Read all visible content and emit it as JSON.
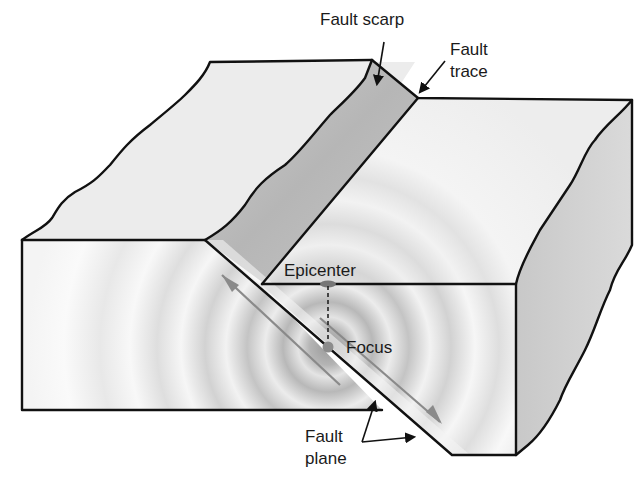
{
  "figure": {
    "labels": {
      "fault_scarp": "Fault scarp",
      "fault_trace_line1": "Fault",
      "fault_trace_line2": "trace",
      "epicenter": "Epicenter",
      "focus": "Focus",
      "fault_plane_line1": "Fault",
      "fault_plane_line2": "plane"
    },
    "colors": {
      "background": "#ffffff",
      "top_surface": "#ececec",
      "front_face": "#f2f2f2",
      "side_face": "#d4d4d4",
      "scarp": "#c2c2c2",
      "outline": "#111111",
      "motion_arrow": "#8a8a8a",
      "focus_dot": "#8c8c8c"
    }
  }
}
